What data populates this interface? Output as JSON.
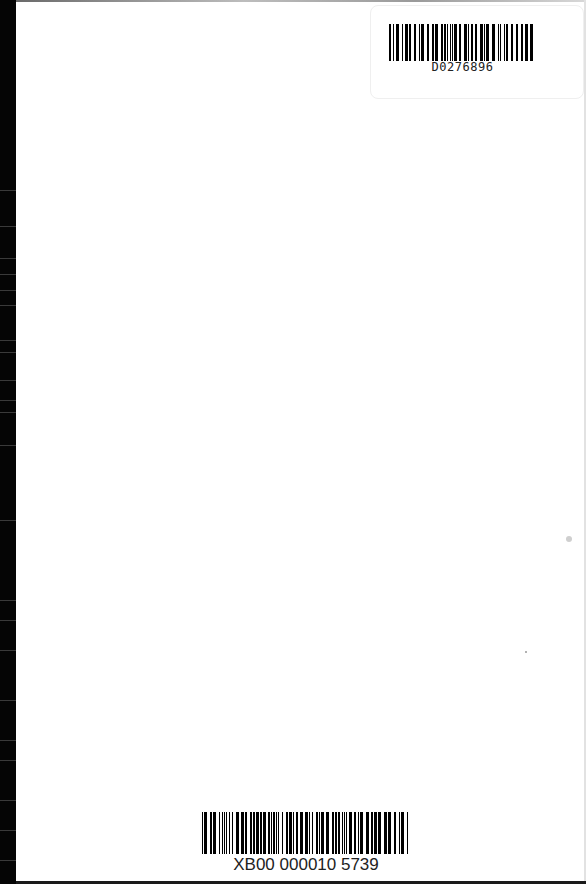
{
  "page": {
    "background": "#ffffff",
    "spine_color": "#050505"
  },
  "library_barcode": {
    "label": "D0276896",
    "position": "top-right"
  },
  "item_barcode": {
    "label": "XB00 000010 5739",
    "position": "bottom-center"
  }
}
